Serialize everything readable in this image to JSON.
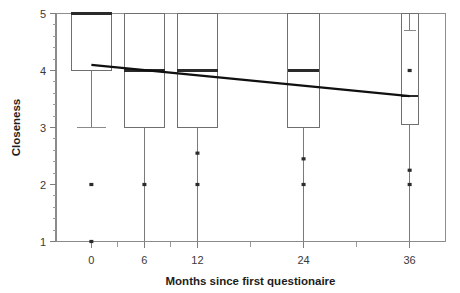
{
  "chart_data": {
    "type": "box",
    "title": "",
    "xlabel": "Months since first questionaire",
    "ylabel": "Closeness",
    "xlim": [
      -4,
      40
    ],
    "ylim": [
      1,
      5
    ],
    "grid": false,
    "legend": "none",
    "x_tick_labels": [
      "0",
      "6",
      "12",
      "24",
      "36"
    ],
    "x_tick_values": [
      0,
      6,
      12,
      24,
      36
    ],
    "y_tick_labels": [
      "1",
      "2",
      "3",
      "4",
      "5"
    ],
    "y_tick_values": [
      1,
      2,
      3,
      4,
      5
    ],
    "y_minor_step": 0.2,
    "categories": [
      "0",
      "6",
      "12",
      "24",
      "36"
    ],
    "boxes": [
      {
        "label": "0",
        "x": 0,
        "whisker_low": 3.0,
        "q1": 4.0,
        "median": 5.0,
        "q3": 5.0,
        "whisker_high": 5.0,
        "outliers": [
          2.0,
          1.0
        ],
        "width_months": 4.6
      },
      {
        "label": "6",
        "x": 6,
        "whisker_low": 1.0,
        "q1": 3.0,
        "median": 4.0,
        "q3": 5.0,
        "whisker_high": 5.0,
        "outliers": [
          2.0
        ],
        "width_months": 4.6
      },
      {
        "label": "12",
        "x": 12,
        "whisker_low": 1.0,
        "q1": 3.0,
        "median": 4.0,
        "q3": 5.0,
        "whisker_high": 5.0,
        "outliers": [
          2.55,
          2.0
        ],
        "width_months": 4.6
      },
      {
        "label": "24",
        "x": 24,
        "whisker_low": 1.0,
        "q1": 3.0,
        "median": 4.0,
        "q3": 5.0,
        "whisker_high": 5.0,
        "outliers": [
          2.45,
          2.0
        ],
        "width_months": 3.6
      },
      {
        "label": "36",
        "x": 36,
        "whisker_low": 1.0,
        "q1": 3.05,
        "median": 3.55,
        "q3": 5.0,
        "whisker_high": 4.7,
        "outliers": [
          2.25,
          2.0,
          4.0
        ],
        "width_months": 1.9
      }
    ],
    "trend_line": {
      "name": "fitted mean",
      "x": [
        0,
        36
      ],
      "y": [
        4.1,
        3.55
      ]
    },
    "colors": {
      "box_stroke": "#6f6f6f",
      "median": "#2a2a2a",
      "trend": "#101010",
      "axis": "#8a8a8a",
      "text": "#1d1d1d"
    }
  }
}
